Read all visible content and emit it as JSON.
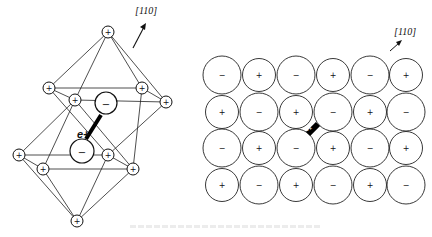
{
  "figure": {
    "left_panel": {
      "name": "octahedral-stacking",
      "direction_label": "[110]",
      "carrier_label": "e+",
      "cations": [
        {
          "id": "u-top",
          "x": 108,
          "y": 32,
          "sign": "+"
        },
        {
          "id": "u-l",
          "x": 49,
          "y": 88,
          "sign": "+"
        },
        {
          "id": "u-r",
          "x": 142,
          "y": 88,
          "sign": "+"
        },
        {
          "id": "u-fl",
          "x": 75,
          "y": 100,
          "sign": "+"
        },
        {
          "id": "u-fr",
          "x": 166,
          "y": 102,
          "sign": "+"
        },
        {
          "id": "l-l",
          "x": 19,
          "y": 155,
          "sign": "+"
        },
        {
          "id": "l-r",
          "x": 108,
          "y": 155,
          "sign": "+"
        },
        {
          "id": "l-fl",
          "x": 43,
          "y": 169,
          "sign": "+"
        },
        {
          "id": "l-fr",
          "x": 133,
          "y": 169,
          "sign": "+"
        },
        {
          "id": "l-bot",
          "x": 77,
          "y": 221,
          "sign": "+"
        }
      ],
      "anions": [
        {
          "id": "a-up",
          "x": 106,
          "y": 103,
          "r": 11,
          "sign": "−"
        },
        {
          "id": "a-low",
          "x": 82,
          "y": 151,
          "r": 12,
          "sign": "−"
        }
      ]
    },
    "right_panel": {
      "name": "square-lattice-110-plane",
      "direction_label": "[110]",
      "carrier_label": "e+",
      "rows": [
        [
          "−",
          "+",
          "−",
          "+",
          "−",
          "+"
        ],
        [
          "+",
          "−",
          "+",
          "−",
          "+",
          "−"
        ],
        [
          "−",
          "+",
          "−",
          "+",
          "−",
          "+"
        ],
        [
          "+",
          "−",
          "+",
          "−",
          "+",
          "−"
        ]
      ],
      "column_x": [
        222,
        259,
        296,
        333,
        370,
        406
      ],
      "row_y": [
        75,
        112,
        148,
        185
      ]
    },
    "caption": ""
  }
}
